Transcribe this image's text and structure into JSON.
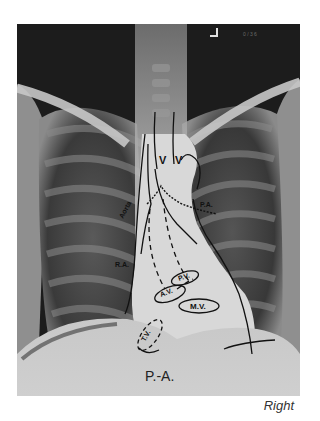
{
  "figure": {
    "view_label": "P.-A.",
    "caption": "Right",
    "film_marker": "",
    "labels": {
      "aorta": "Aorta",
      "pulmonary_artery": "P.A.",
      "right_atrium": "R.A.",
      "aortic_valve": "A.V.",
      "pulmonic_valve": "P.V.",
      "mitral_valve": "M.V.",
      "tricuspid_valve": "T.V.",
      "vena_left": "V",
      "vena_right": "V"
    }
  }
}
